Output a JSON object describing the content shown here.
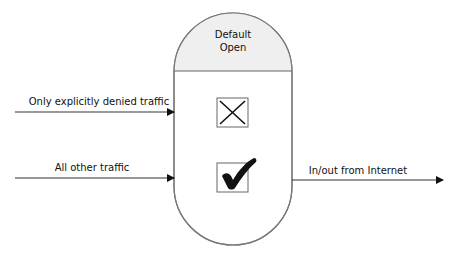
{
  "diagram": {
    "firewall": {
      "title_line1": "Default",
      "title_line2": "Open",
      "header_fill": "#efefef",
      "body_fill": "#ffffff",
      "outline_color": "#777777"
    },
    "inputs": [
      {
        "label": "Only explicitly denied traffic",
        "result": "denied",
        "icon": "x-mark-icon"
      },
      {
        "label": "All other traffic",
        "result": "allowed",
        "icon": "check-mark-icon"
      }
    ],
    "output": {
      "label": "In/out from Internet"
    },
    "colors": {
      "line": "#333333",
      "text": "#111111"
    }
  }
}
